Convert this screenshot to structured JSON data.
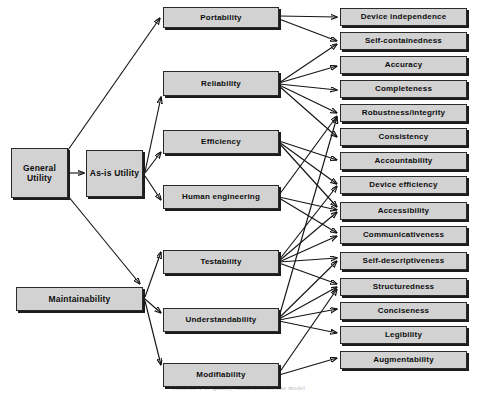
{
  "diagram": {
    "type": "hierarchy-tree",
    "caption": "FIGURE 1-1. Quality characteristics tree model",
    "colors": {
      "node_fill": "#d2d2d2",
      "node_border": "#2a2a2a",
      "node_shadow": "#1c1c1c",
      "arrow": "#151515",
      "background": "#ffffff"
    },
    "levels": {
      "root": "General Utility",
      "level2": [
        "As-is Utility",
        "Maintainability"
      ],
      "level3": [
        "Portability",
        "Reliability",
        "Efficiency",
        "Human engineering",
        "Testability",
        "Understandability",
        "Modifiability"
      ],
      "level4": [
        "Device independence",
        "Self-containedness",
        "Accuracy",
        "Completeness",
        "Robustness/integrity",
        "Consistency",
        "Accountability",
        "Device efficiency",
        "Accessibility",
        "Communicativeness",
        "Self-descriptiveness",
        "Structuredness",
        "Conciseness",
        "Legibility",
        "Augmentability"
      ]
    },
    "nodes": {
      "general_utility": "General Utility",
      "as_is_utility": "As-is Utility",
      "maintainability": "Maintainability",
      "portability": "Portability",
      "reliability": "Reliability",
      "efficiency": "Efficiency",
      "human_engineering": "Human engineering",
      "testability": "Testability",
      "understandability": "Understandability",
      "modifiability": "Modifiability",
      "device_independence": "Device independence",
      "self_containedness": "Self-containedness",
      "accuracy": "Accuracy",
      "completeness": "Completeness",
      "robustness_integrity": "Robustness/integrity",
      "consistency": "Consistency",
      "accountability": "Accountability",
      "device_efficiency": "Device efficiency",
      "accessibility": "Accessibility",
      "communicativeness": "Communicativeness",
      "self_descriptiveness": "Self-descriptiveness",
      "structuredness": "Structuredness",
      "conciseness": "Conciseness",
      "legibility": "Legibility",
      "augmentability": "Augmentability"
    },
    "edges": [
      {
        "from": "General Utility",
        "to": "Portability"
      },
      {
        "from": "General Utility",
        "to": "As-is Utility"
      },
      {
        "from": "General Utility",
        "to": "Maintainability"
      },
      {
        "from": "As-is Utility",
        "to": "Reliability"
      },
      {
        "from": "As-is Utility",
        "to": "Efficiency"
      },
      {
        "from": "As-is Utility",
        "to": "Human engineering"
      },
      {
        "from": "Maintainability",
        "to": "Testability"
      },
      {
        "from": "Maintainability",
        "to": "Understandability"
      },
      {
        "from": "Maintainability",
        "to": "Modifiability"
      },
      {
        "from": "Portability",
        "to": "Device independence"
      },
      {
        "from": "Portability",
        "to": "Self-containedness"
      },
      {
        "from": "Reliability",
        "to": "Self-containedness"
      },
      {
        "from": "Reliability",
        "to": "Accuracy"
      },
      {
        "from": "Reliability",
        "to": "Completeness"
      },
      {
        "from": "Reliability",
        "to": "Robustness/integrity"
      },
      {
        "from": "Reliability",
        "to": "Consistency"
      },
      {
        "from": "Efficiency",
        "to": "Accountability"
      },
      {
        "from": "Efficiency",
        "to": "Device efficiency"
      },
      {
        "from": "Efficiency",
        "to": "Accessibility"
      },
      {
        "from": "Human engineering",
        "to": "Accessibility"
      },
      {
        "from": "Human engineering",
        "to": "Communicativeness"
      },
      {
        "from": "Human engineering",
        "to": "Robustness/integrity"
      },
      {
        "from": "Testability",
        "to": "Accountability"
      },
      {
        "from": "Testability",
        "to": "Accessibility"
      },
      {
        "from": "Testability",
        "to": "Communicativeness"
      },
      {
        "from": "Testability",
        "to": "Self-descriptiveness"
      },
      {
        "from": "Testability",
        "to": "Structuredness"
      },
      {
        "from": "Understandability",
        "to": "Consistency"
      },
      {
        "from": "Understandability",
        "to": "Self-descriptiveness"
      },
      {
        "from": "Understandability",
        "to": "Structuredness"
      },
      {
        "from": "Understandability",
        "to": "Conciseness"
      },
      {
        "from": "Understandability",
        "to": "Legibility"
      },
      {
        "from": "Modifiability",
        "to": "Structuredness"
      },
      {
        "from": "Modifiability",
        "to": "Augmentability"
      }
    ]
  }
}
